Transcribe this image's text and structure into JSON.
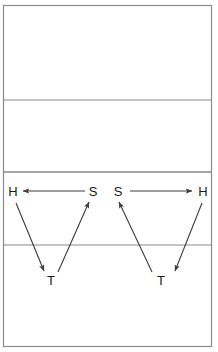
{
  "diagram": {
    "canvas": {
      "width": 218,
      "height": 352,
      "background": "#ffffff"
    },
    "colors": {
      "border": "#8a8a8a",
      "divider": "#8a8a8a",
      "arrow": "#3c3c3c",
      "label": "#1a1a1a"
    },
    "border": {
      "x": 3.5,
      "y": 5.5,
      "width": 208,
      "height": 341,
      "stroke_width": 1.2
    },
    "dividers": [
      {
        "name": "divider-line-1",
        "y": 100,
        "x1": 4,
        "x2": 211,
        "stroke_width": 1.2
      },
      {
        "name": "divider-line-2",
        "y": 172,
        "x1": 4,
        "x2": 211,
        "stroke_width": 1.4
      },
      {
        "name": "divider-line-3",
        "y": 245,
        "x1": 4,
        "x2": 211,
        "stroke_width": 1.2
      }
    ],
    "zones": [
      {
        "name": "zone-top",
        "label": ""
      },
      {
        "name": "zone-upper-middle",
        "label": ""
      },
      {
        "name": "zone-lower-middle",
        "label": ""
      },
      {
        "name": "zone-bottom",
        "label": ""
      }
    ],
    "labels": [
      {
        "id": "label-h-left",
        "text": "H",
        "x": 13,
        "y": 196
      },
      {
        "id": "label-s-left",
        "text": "S",
        "x": 93,
        "y": 196
      },
      {
        "id": "label-s-right",
        "text": "S",
        "x": 118,
        "y": 196
      },
      {
        "id": "label-h-right",
        "text": "H",
        "x": 203,
        "y": 196
      },
      {
        "id": "label-t-left",
        "text": "T",
        "x": 51,
        "y": 285
      },
      {
        "id": "label-t-right",
        "text": "T",
        "x": 161,
        "y": 285
      }
    ],
    "arrows": [
      {
        "id": "arrow-s-to-h-left",
        "from": "S",
        "to": "H",
        "x1": 85,
        "y1": 191,
        "x2": 23,
        "y2": 191,
        "direction": "left",
        "stroke_width": 1.1
      },
      {
        "id": "arrow-s-to-h-right",
        "from": "S",
        "to": "H",
        "x1": 130,
        "y1": 191,
        "x2": 192,
        "y2": 191,
        "direction": "right",
        "stroke_width": 1.1
      },
      {
        "id": "arrow-h-to-t-left",
        "from": "H",
        "to": "T",
        "x1": 16,
        "y1": 203,
        "x2": 44,
        "y2": 271,
        "direction": "down-right",
        "stroke_width": 1.1
      },
      {
        "id": "arrow-t-to-s-left",
        "from": "T",
        "to": "S",
        "x1": 58,
        "y1": 272,
        "x2": 89,
        "y2": 202,
        "direction": "up-right",
        "stroke_width": 1.1
      },
      {
        "id": "arrow-t-to-s-right",
        "from": "T",
        "to": "S",
        "x1": 152,
        "y1": 272,
        "x2": 119,
        "y2": 202,
        "direction": "up-left",
        "stroke_width": 1.1
      },
      {
        "id": "arrow-h-to-t-right",
        "from": "H",
        "to": "T",
        "x1": 202,
        "y1": 203,
        "x2": 175,
        "y2": 271,
        "direction": "down-left",
        "stroke_width": 1.1
      }
    ]
  }
}
